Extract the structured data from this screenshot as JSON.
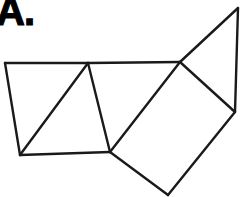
{
  "figure": {
    "label": "A.",
    "label_name": "figure-label-a",
    "background_color": "#ffffff",
    "line_color": "#1a1a1a",
    "line_width": 2.4,
    "canvas": {
      "width": 252,
      "height": 197
    },
    "vertices": {
      "top_left": [
        5,
        63
      ],
      "bottom_left": [
        20,
        155
      ],
      "top_mid": [
        88,
        63
      ],
      "bottom_mid": [
        110,
        152
      ],
      "top_right_junction": [
        180,
        62
      ],
      "apex": [
        238,
        8
      ],
      "right_junction": [
        235,
        112
      ],
      "bottom_vertex": [
        168,
        195
      ]
    },
    "edges": [
      {
        "name": "top-edge-left",
        "from": [
          5,
          63
        ],
        "to": [
          88,
          63
        ]
      },
      {
        "name": "top-edge-right",
        "from": [
          88,
          63
        ],
        "to": [
          180,
          62
        ]
      },
      {
        "name": "left-edge",
        "from": [
          5,
          63
        ],
        "to": [
          20,
          155
        ]
      },
      {
        "name": "bottom-edge-left",
        "from": [
          20,
          155
        ],
        "to": [
          110,
          152
        ]
      },
      {
        "name": "inner-vertical-edge",
        "from": [
          88,
          63
        ],
        "to": [
          110,
          152
        ]
      },
      {
        "name": "inner-diagonal",
        "from": [
          88,
          63
        ],
        "to": [
          20,
          155
        ]
      },
      {
        "name": "square-upper-left",
        "from": [
          110,
          152
        ],
        "to": [
          180,
          62
        ]
      },
      {
        "name": "apex-left-edge",
        "from": [
          180,
          62
        ],
        "to": [
          238,
          8
        ]
      },
      {
        "name": "apex-right-edge",
        "from": [
          238,
          8
        ],
        "to": [
          235,
          112
        ]
      },
      {
        "name": "square-upper-right",
        "from": [
          180,
          62
        ],
        "to": [
          235,
          112
        ]
      },
      {
        "name": "square-lower-right",
        "from": [
          235,
          112
        ],
        "to": [
          168,
          195
        ]
      },
      {
        "name": "square-lower-left",
        "from": [
          168,
          195
        ],
        "to": [
          110,
          152
        ]
      }
    ],
    "faces": [
      {
        "name": "upper-left-triangle",
        "points": "5,63 88,63 20,155"
      },
      {
        "name": "lower-left-triangle",
        "points": "88,63 110,152 20,155"
      },
      {
        "name": "tilted-square",
        "points": "110,152 180,62 235,112 168,195"
      },
      {
        "name": "top-right-triangle",
        "points": "180,62 238,8 235,112"
      }
    ]
  }
}
